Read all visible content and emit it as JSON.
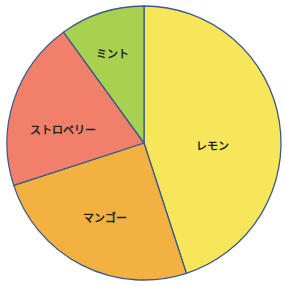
{
  "chart_data": {
    "type": "pie",
    "title": "",
    "categories": [
      "レモン",
      "マンゴー",
      "ストロベリー",
      "ミント"
    ],
    "values": [
      45,
      25,
      20,
      10
    ],
    "colors": [
      "#f7e65a",
      "#f3b13f",
      "#f0806a",
      "#a7d14f"
    ],
    "start_angle": "top, clockwise",
    "legend": "none (labels inside slices)"
  },
  "labels": {
    "lemon": "レモン",
    "mango": "マンゴー",
    "strawberry": "ストロベリー",
    "mint": "ミント"
  },
  "style": {
    "border_color": "#3e5a8a"
  }
}
